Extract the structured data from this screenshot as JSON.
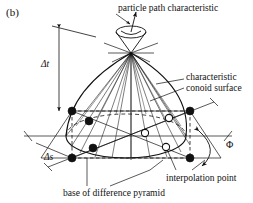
{
  "figure": {
    "panel_label": "(b)",
    "background_color": "#ffffff",
    "ink_color": "#111111"
  },
  "labels": {
    "particle_path": "particle path characteristic",
    "conoid_line1": "characteristic",
    "conoid_line2": "conoid surface",
    "interpolation_point": "interpolation point",
    "base_pyramid": "base of difference pyramid",
    "delta_t": "Δt",
    "delta_s": "Δs",
    "phi": "Φ"
  },
  "geometry": {
    "apex": {
      "x": 131,
      "y": 53
    },
    "base_ellipse": {
      "cx": 126,
      "cy": 136,
      "rx": 60,
      "ry": 22
    },
    "plane_corners": [
      {
        "x": 72,
        "y": 111
      },
      {
        "x": 190,
        "y": 111
      },
      {
        "x": 221,
        "y": 158
      },
      {
        "x": 41,
        "y": 158
      }
    ],
    "filled_nodes": [
      {
        "x": 72,
        "y": 111
      },
      {
        "x": 190,
        "y": 111
      },
      {
        "x": 72,
        "y": 158
      },
      {
        "x": 190,
        "y": 158
      },
      {
        "x": 89,
        "y": 121
      },
      {
        "x": 93,
        "y": 148
      }
    ],
    "open_nodes": [
      {
        "x": 169,
        "y": 118
      },
      {
        "x": 145,
        "y": 133
      },
      {
        "x": 166,
        "y": 147
      }
    ],
    "cone_tip_ellipse": {
      "cx": 131,
      "cy": 32,
      "rx": 15,
      "ry": 6
    },
    "delta_t_span": {
      "x": 59,
      "y_top": 28,
      "y_bottom": 111
    },
    "phi_arc": {
      "cx": 210,
      "cy": 150
    }
  }
}
